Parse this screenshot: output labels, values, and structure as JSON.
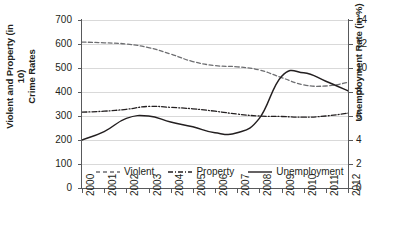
{
  "chart_data": {
    "type": "line",
    "title": "",
    "xlabel": "",
    "ylabel": "Violent and Property (in 10)\nCrime Rates",
    "ylabel_right": "Unemployment Rate (in %)",
    "x": [
      2000,
      2001,
      2002,
      2003,
      2004,
      2005,
      2006,
      2007,
      2008,
      2009,
      2010,
      2011,
      2012
    ],
    "xticklabels": [
      "2000",
      "2001",
      "2002",
      "2003",
      "2004",
      "2005",
      "2006",
      "2007",
      "2008",
      "2009",
      "2010",
      "2011",
      "2012"
    ],
    "ylim": [
      0,
      700
    ],
    "yticks": [
      0,
      100,
      200,
      300,
      400,
      500,
      600,
      700
    ],
    "yticklabels": [
      "0",
      "100",
      "200",
      "300",
      "400",
      "500",
      "600",
      "700"
    ],
    "ylim_right": [
      0,
      14
    ],
    "yticks_right": [
      0,
      2,
      4,
      6,
      8,
      10,
      12,
      14
    ],
    "yticklabels_right": [
      "0",
      "2",
      "4",
      "6",
      "8",
      "10",
      "12",
      "14"
    ],
    "grid": true,
    "legend_position": "inside-bottom",
    "series": [
      {
        "name": "Violent",
        "axis": "left",
        "style": "dashed",
        "color": "#6d6e71",
        "values": [
          608,
          605,
          600,
          585,
          558,
          527,
          510,
          505,
          492,
          460,
          430,
          425,
          440
        ]
      },
      {
        "name": "Property",
        "axis": "left",
        "style": "dash-dot",
        "color": "#231f20",
        "values": [
          316,
          320,
          328,
          340,
          336,
          330,
          320,
          308,
          300,
          298,
          295,
          300,
          312
        ]
      },
      {
        "name": "Unemployment",
        "axis": "right",
        "style": "solid",
        "color": "#231f20",
        "values": [
          4.0,
          4.7,
          5.8,
          6.0,
          5.5,
          5.1,
          4.6,
          4.6,
          5.8,
          9.3,
          9.6,
          8.9,
          8.1
        ]
      }
    ]
  },
  "legend": {
    "items": [
      {
        "label": "Violent",
        "style": "dashed"
      },
      {
        "label": "Property",
        "style": "dash-dot"
      },
      {
        "label": "Unemployment",
        "style": "solid"
      }
    ]
  }
}
